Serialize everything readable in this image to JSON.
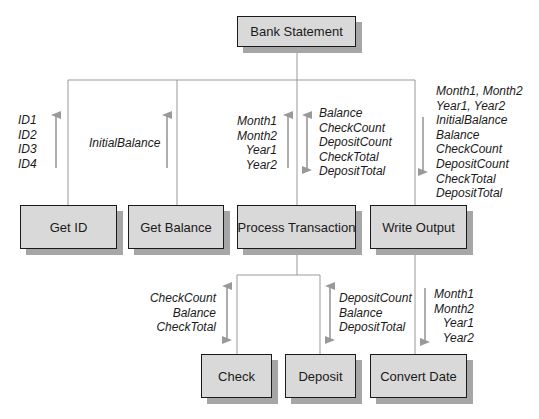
{
  "diagram": {
    "colors": {
      "box_fill": "#d9d9d9",
      "box_border": "#1a1a1a",
      "box_shadow": "#a6a6a6",
      "connector": "#999999",
      "arrow": "#999999",
      "text": "#1a1a1a"
    },
    "nodes": {
      "root": {
        "label": "Bank Statement"
      },
      "get_id": {
        "label": "Get ID"
      },
      "get_balance": {
        "label": "Get Balance"
      },
      "process_transaction": {
        "label": "Process Transaction"
      },
      "write_output": {
        "label": "Write Output"
      },
      "check": {
        "label": "Check"
      },
      "deposit": {
        "label": "Deposit"
      },
      "convert_date": {
        "label": "Convert Date"
      }
    },
    "edges": [
      {
        "from": "root",
        "to": "get_id"
      },
      {
        "from": "root",
        "to": "get_balance"
      },
      {
        "from": "root",
        "to": "process_transaction"
      },
      {
        "from": "root",
        "to": "write_output"
      },
      {
        "from": "process_transaction",
        "to": "check"
      },
      {
        "from": "process_transaction",
        "to": "deposit"
      },
      {
        "from": "write_output",
        "to": "convert_date"
      }
    ],
    "flows": {
      "get_id": {
        "direction": "up",
        "params": [
          "ID1",
          "ID2",
          "ID3",
          "ID4"
        ]
      },
      "get_balance": {
        "direction": "up",
        "params": [
          "InitialBalance"
        ]
      },
      "process_transaction_in": {
        "direction": "up",
        "params": [
          "Month1",
          "Month2",
          "Year1",
          "Year2"
        ]
      },
      "process_transaction_inout": {
        "direction": "both",
        "params": [
          "Balance",
          "CheckCount",
          "DepositCount",
          "CheckTotal",
          "DepositTotal"
        ]
      },
      "write_output": {
        "direction": "down",
        "params": [
          "Month1, Month2",
          "Year1, Year2",
          "InitialBalance",
          "Balance",
          "CheckCount",
          "DepositCount",
          "CheckTotal",
          "DepositTotal"
        ]
      },
      "check": {
        "direction": "both",
        "params": [
          "CheckCount",
          "Balance",
          "CheckTotal"
        ]
      },
      "deposit": {
        "direction": "both",
        "params": [
          "DepositCount",
          "Balance",
          "DepositTotal"
        ]
      },
      "convert_date": {
        "direction": "down",
        "params": [
          "Month1",
          "Month2",
          "Year1",
          "Year2"
        ]
      }
    }
  }
}
